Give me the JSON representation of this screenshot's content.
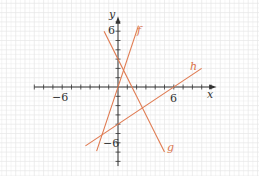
{
  "chart_data": {
    "type": "line",
    "title": "",
    "xlabel": "x",
    "ylabel": "y",
    "xlim": [
      -9,
      10
    ],
    "ylim": [
      -9,
      8
    ],
    "grid": true,
    "tick_labels": {
      "x": [
        "-6",
        "6"
      ],
      "y": [
        "6",
        "-6"
      ]
    },
    "series": [
      {
        "name": "f",
        "equation": "y = 3x",
        "slope": 3,
        "intercept": 0,
        "x_range": [
          -2.3,
          2.2
        ],
        "color": "#e07a50"
      },
      {
        "name": "g",
        "equation": "y = -2x + 3",
        "slope": -2,
        "intercept": 3,
        "x_range": [
          -1.5,
          5
        ],
        "color": "#e07a50"
      },
      {
        "name": "h",
        "equation": "y = (2/3)x - 4",
        "slope": 0.6667,
        "intercept": -4,
        "x_range": [
          -3.5,
          9
        ],
        "color": "#e07a50"
      }
    ],
    "annotations": [
      {
        "text": "f",
        "x": 2.2,
        "y": 5.8
      },
      {
        "text": "g",
        "x": 5.2,
        "y": -6.5
      },
      {
        "text": "h",
        "x": 8,
        "y": 2.3
      }
    ]
  },
  "labels": {
    "x_axis": "x",
    "y_axis": "y",
    "x_neg": "−6",
    "x_pos": "6",
    "y_pos": "6",
    "y_neg": "−6",
    "f": "f",
    "g": "g",
    "h": "h"
  }
}
